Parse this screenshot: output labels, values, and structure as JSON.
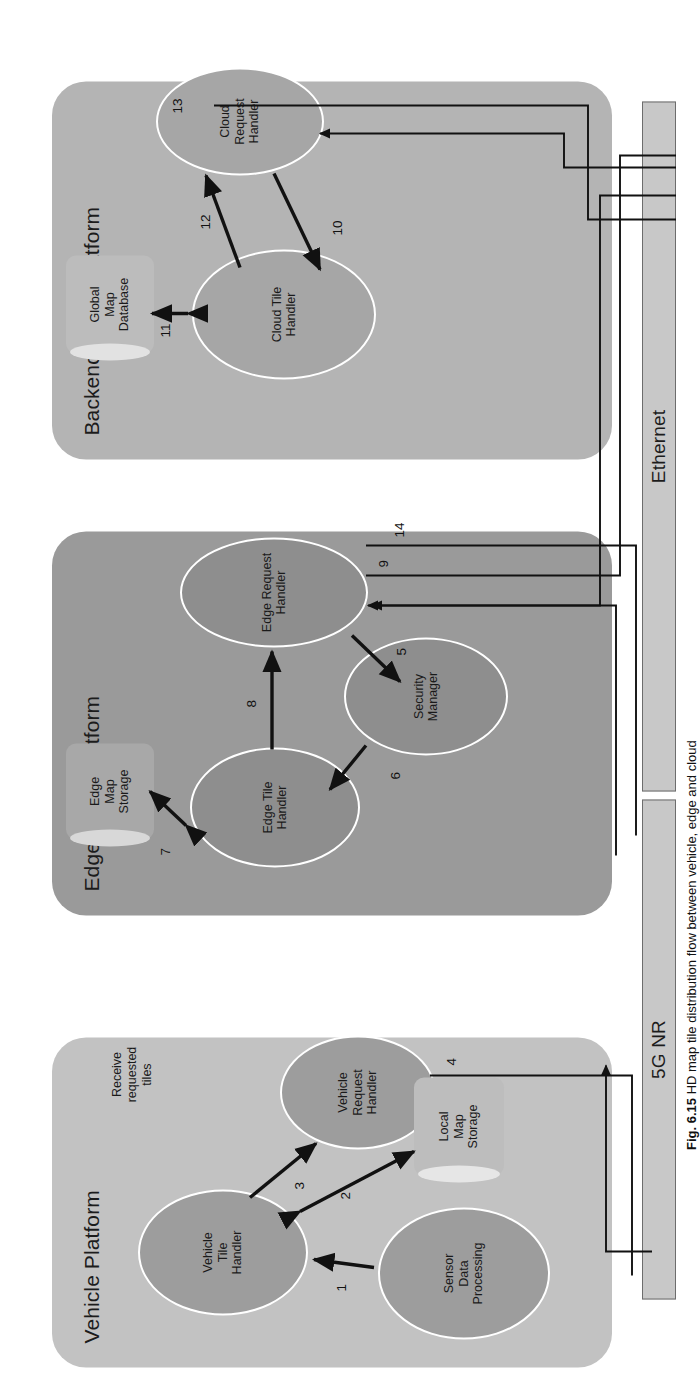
{
  "figure": {
    "caption_label": "Fig. 6.15",
    "caption_text": "HD map tile distribution flow between vehicle, edge and cloud"
  },
  "platforms": [
    {
      "id": "vehicle",
      "title": "Vehicle Platform",
      "color": "#c2c2c2"
    },
    {
      "id": "edge",
      "title": "Edge Cloud Platform",
      "color": "#9a9a9a"
    },
    {
      "id": "backend",
      "title": "Backend Cloud Platform",
      "color": "#b4b4b4"
    }
  ],
  "nodes": [
    {
      "id": "sensor-data-processing",
      "label": "Sensor\nData\nProcessing",
      "shape": "ellipse",
      "platform": "vehicle"
    },
    {
      "id": "vehicle-tile-handler",
      "label": "Vehicle\nTile\nHandler",
      "shape": "ellipse",
      "platform": "vehicle"
    },
    {
      "id": "vehicle-request-handler",
      "label": "Vehicle\nRequest\nHandler",
      "shape": "ellipse",
      "platform": "vehicle"
    },
    {
      "id": "local-map-storage",
      "label": "Local\nMap\nStorage",
      "shape": "cylinder",
      "platform": "vehicle"
    },
    {
      "id": "edge-tile-handler",
      "label": "Edge Tile\nHandler",
      "shape": "ellipse",
      "platform": "edge"
    },
    {
      "id": "security-manager",
      "label": "Security\nManager",
      "shape": "ellipse",
      "platform": "edge"
    },
    {
      "id": "edge-request-handler",
      "label": "Edge Request\nHandler",
      "shape": "ellipse",
      "platform": "edge"
    },
    {
      "id": "edge-map-storage",
      "label": "Edge\nMap\nStorage",
      "shape": "cylinder",
      "platform": "edge"
    },
    {
      "id": "cloud-tile-handler",
      "label": "Cloud Tile\nHandler",
      "shape": "ellipse",
      "platform": "backend"
    },
    {
      "id": "cloud-request-handler",
      "label": "Cloud\nRequest\nHandler",
      "shape": "ellipse",
      "platform": "backend"
    },
    {
      "id": "global-map-database",
      "label": "Global\nMap\nDatabase",
      "shape": "cylinder",
      "platform": "backend"
    }
  ],
  "annotations": [
    {
      "id": "receive-requested-tiles",
      "label": "Receive\nrequested\ntiles"
    }
  ],
  "buses": [
    {
      "id": "bus-5g-nr",
      "label": "5G NR"
    },
    {
      "id": "bus-ethernet",
      "label": "Ethernet"
    }
  ],
  "edge_numbers": [
    {
      "n": "1",
      "from": "sensor-data-processing",
      "to": "vehicle-tile-handler",
      "arrow": "single"
    },
    {
      "n": "2",
      "from": "vehicle-tile-handler",
      "to": "local-map-storage",
      "arrow": "double"
    },
    {
      "n": "3",
      "from": "vehicle-tile-handler",
      "to": "vehicle-request-handler",
      "arrow": "single"
    },
    {
      "n": "4",
      "from": "vehicle-request-handler",
      "to": "bus-5g-nr",
      "arrow": "line"
    },
    {
      "n": "5",
      "from": "edge-request-handler",
      "to": "security-manager",
      "arrow": "single"
    },
    {
      "n": "6",
      "from": "security-manager",
      "to": "edge-tile-handler",
      "arrow": "single"
    },
    {
      "n": "7",
      "from": "edge-tile-handler",
      "to": "edge-map-storage",
      "arrow": "double"
    },
    {
      "n": "8",
      "from": "edge-tile-handler",
      "to": "edge-request-handler",
      "arrow": "single"
    },
    {
      "n": "9",
      "from": "edge-request-handler",
      "to": "bus-ethernet",
      "arrow": "line"
    },
    {
      "n": "10",
      "from": "cloud-request-handler",
      "to": "cloud-tile-handler",
      "arrow": "single"
    },
    {
      "n": "11",
      "from": "cloud-tile-handler",
      "to": "global-map-database",
      "arrow": "double"
    },
    {
      "n": "12",
      "from": "cloud-tile-handler",
      "to": "cloud-request-handler",
      "arrow": "single"
    },
    {
      "n": "13",
      "from": "cloud-request-handler",
      "to": "bus-ethernet",
      "arrow": "line"
    },
    {
      "n": "14",
      "from": "edge-request-handler",
      "to": "bus-5g-nr",
      "arrow": "line"
    }
  ]
}
